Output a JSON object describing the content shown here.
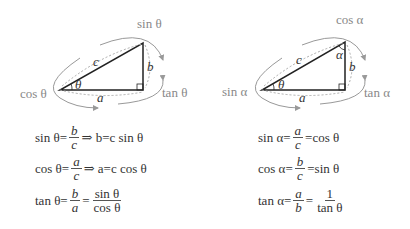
{
  "left_diagram": {
    "side_labels": {
      "hypotenuse": "c",
      "opposite": "b",
      "adjacent": "a"
    },
    "angle_label": "θ",
    "ratio_labels": {
      "sin": "sin θ",
      "cos": "cos θ",
      "tan": "tan θ"
    }
  },
  "right_diagram": {
    "side_labels": {
      "hypotenuse": "c",
      "opposite": "b",
      "adjacent": "a"
    },
    "angle_labels": {
      "base": "θ",
      "top": "α"
    },
    "ratio_labels": {
      "cos": "cos α",
      "sin": "sin α",
      "tan": "tan α"
    }
  },
  "left_equations": [
    {
      "lhs": "sin θ=",
      "num": "b",
      "den": "c",
      "rest": "⇒ b=c sin θ"
    },
    {
      "lhs": "cos θ=",
      "num": "a",
      "den": "c",
      "rest": "⇒ a=c cos θ"
    },
    {
      "lhs": "tan θ=",
      "num": "b",
      "den": "a",
      "mid": "=",
      "num2": "sin θ",
      "den2": "cos θ"
    }
  ],
  "right_equations": [
    {
      "lhs": "sin α=",
      "num": "a",
      "den": "c",
      "rest": "=cos θ"
    },
    {
      "lhs": "cos α=",
      "num": "b",
      "den": "c",
      "rest": "=sin θ"
    },
    {
      "lhs": "tan α=",
      "num": "a",
      "den": "b",
      "mid": "=",
      "num2": "1",
      "den2": "tan θ"
    }
  ],
  "colors": {
    "line": "#222222",
    "arrow": "#999999",
    "label": "#888888"
  }
}
